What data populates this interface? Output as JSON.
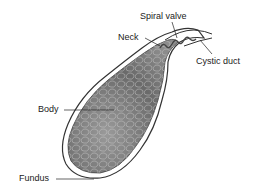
{
  "diagram": {
    "labels": {
      "spiral_valve": "Spiral valve",
      "neck": "Neck",
      "cystic_duct": "Cystic duct",
      "body": "Body",
      "fundus": "Fundus"
    },
    "colors": {
      "outline": "#333333",
      "fill_dark": "#5a5a5a",
      "fill_light": "#b8b8b8",
      "label": "#222222"
    }
  }
}
